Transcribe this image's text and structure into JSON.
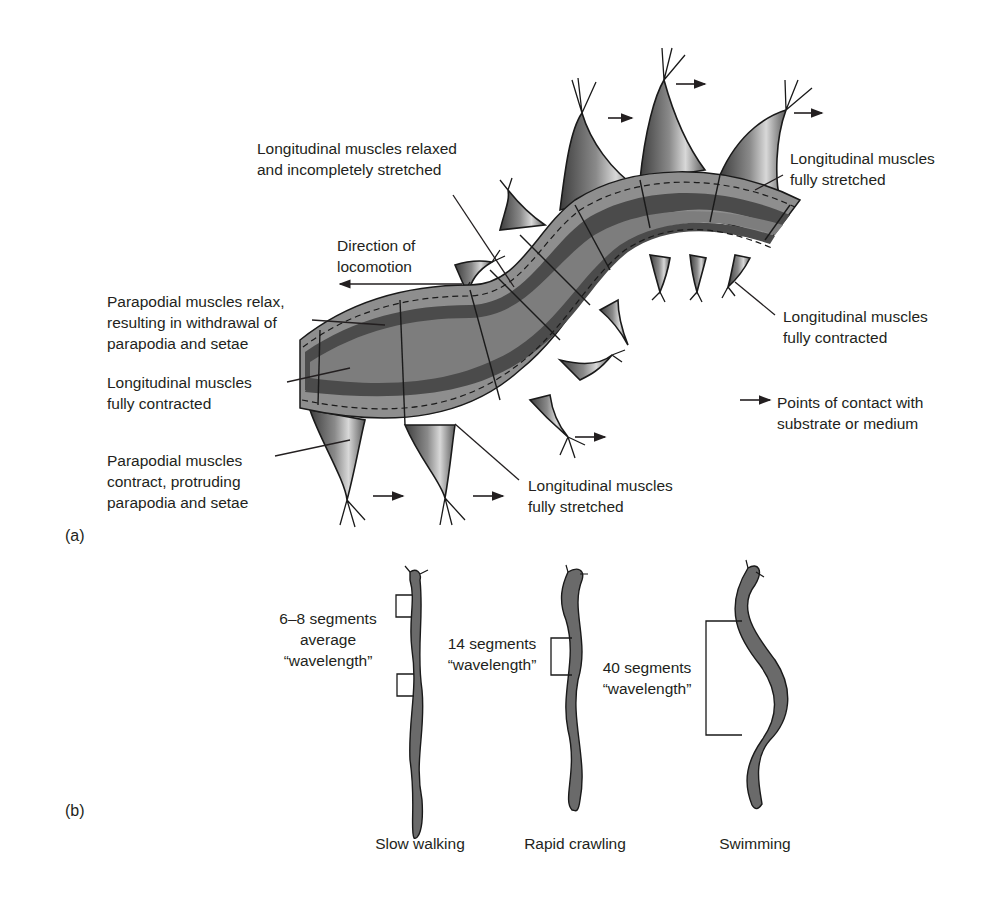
{
  "panel_a": {
    "label": "(a)",
    "labels": {
      "relaxed_incomplete": [
        "Longitudinal muscles relaxed",
        "and incompletely stretched"
      ],
      "direction": [
        "Direction of",
        "locomotion"
      ],
      "parapodial_relax": [
        "Parapodial muscles relax,",
        "resulting in withdrawal of",
        "parapodia and setae"
      ],
      "long_contracted_left": [
        "Longitudinal muscles",
        "fully contracted"
      ],
      "parapodial_contract": [
        "Parapodial muscles",
        "contract, protruding",
        "parapodia and setae"
      ],
      "long_stretched_bottom": [
        "Longitudinal muscles",
        "fully stretched"
      ],
      "long_stretched_top": [
        "Longitudinal muscles",
        "fully stretched"
      ],
      "long_contracted_right": [
        "Longitudinal muscles",
        "fully contracted"
      ],
      "legend": [
        "Points of contact with",
        "substrate or medium"
      ]
    },
    "colors": {
      "outer_band": "#8e8e8e",
      "light_band": "#7d7d7d",
      "dark_band": "#4b4b4b",
      "outline": "#1a1a1a",
      "parapodium": "#6e6e6e"
    }
  },
  "panel_b": {
    "label": "(b)",
    "worms": [
      {
        "name": "Slow walking",
        "annotation": [
          "6–8 segments",
          "average",
          "“wavelength”"
        ]
      },
      {
        "name": "Rapid crawling",
        "annotation": [
          "14 segments",
          "“wavelength”"
        ]
      },
      {
        "name": "Swimming",
        "annotation": [
          "40 segments",
          "“wavelength”"
        ]
      }
    ]
  }
}
